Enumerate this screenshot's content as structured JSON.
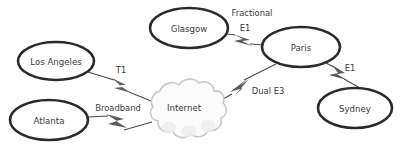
{
  "diagram": {
    "background_color": "#ffffff",
    "node_stroke_color": "#2b2b2b",
    "link_color": "#4a4a4a",
    "bolt_color": "#5b5b5b",
    "cloud_fill": "#fbfbfb",
    "cloud_stroke": "#c9c9c9",
    "text_color": "#3a3a3a",
    "nodes": [
      {
        "id": "los-angeles",
        "label": "Los Angeles",
        "shape": "ellipse",
        "cx": 56,
        "cy": 61,
        "rx": 38,
        "ry": 19
      },
      {
        "id": "atlanta",
        "label": "Atlanta",
        "shape": "ellipse",
        "cx": 49,
        "cy": 120,
        "rx": 39,
        "ry": 20
      },
      {
        "id": "glasgow",
        "label": "Glasgow",
        "shape": "ellipse",
        "cx": 189,
        "cy": 28,
        "rx": 39,
        "ry": 20
      },
      {
        "id": "paris",
        "label": "Paris",
        "shape": "ellipse",
        "cx": 301,
        "cy": 47,
        "rx": 39,
        "ry": 20
      },
      {
        "id": "sydney",
        "label": "Sydney",
        "shape": "ellipse",
        "cx": 355,
        "cy": 108,
        "rx": 37,
        "ry": 20
      },
      {
        "id": "internet",
        "label": "Internet",
        "shape": "cloud",
        "cx": 184,
        "cy": 110
      }
    ],
    "links": [
      {
        "id": "la-internet",
        "from": "los-angeles",
        "to": "internet",
        "label": "T1",
        "label_x": 121,
        "label_y": 70,
        "label_lines": [
          "T1"
        ]
      },
      {
        "id": "atlanta-internet",
        "from": "atlanta",
        "to": "internet",
        "label": "Broadband",
        "label_x": 118,
        "label_y": 108,
        "label_lines": [
          "Broadband"
        ]
      },
      {
        "id": "glasgow-paris",
        "from": "glasgow",
        "to": "paris",
        "label": "Fractional E1",
        "label_x": 252,
        "label_y": 13,
        "label_lines": [
          "Fractional",
          "E1"
        ]
      },
      {
        "id": "internet-paris",
        "from": "internet",
        "to": "paris",
        "label": "Dual E3",
        "label_x": 268,
        "label_y": 91,
        "label_lines": [
          "Dual E3"
        ]
      },
      {
        "id": "paris-sydney",
        "from": "paris",
        "to": "sydney",
        "label": "E1",
        "label_x": 350,
        "label_y": 68,
        "label_lines": [
          "E1"
        ]
      }
    ]
  }
}
